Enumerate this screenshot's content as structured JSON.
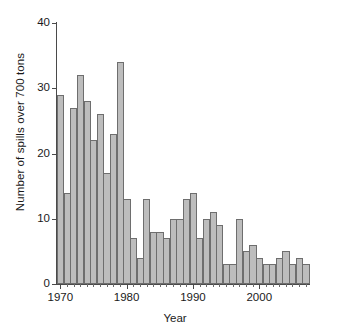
{
  "chart_data": {
    "type": "bar",
    "title": "",
    "subtitle": "",
    "xlabel": "Year",
    "ylabel": "Number of spills over 700 tons",
    "xlim": [
      1969,
      2008
    ],
    "ylim": [
      0,
      40
    ],
    "ytick_labels": [
      "0",
      "10",
      "20",
      "30",
      "40"
    ],
    "ytick_values": [
      0,
      10,
      20,
      30,
      40
    ],
    "xtick_labels": [
      "1970",
      "1980",
      "1990",
      "2000"
    ],
    "xtick_values": [
      1970,
      1980,
      1990,
      2000
    ],
    "grid": false,
    "legend": null,
    "annotations": [],
    "bar_color": "#bdbdbd",
    "bar_edge_color": "#6e6e6e",
    "categories": [
      "1970",
      "1971",
      "1972",
      "1973",
      "1974",
      "1975",
      "1976",
      "1977",
      "1978",
      "1979",
      "1980",
      "1981",
      "1982",
      "1983",
      "1984",
      "1985",
      "1986",
      "1987",
      "1988",
      "1989",
      "1990",
      "1991",
      "1992",
      "1993",
      "1994",
      "1995",
      "1996",
      "1997",
      "1998",
      "1999",
      "2000",
      "2001",
      "2002",
      "2003",
      "2004",
      "2005",
      "2006",
      "2007"
    ],
    "values": [
      29,
      14,
      27,
      32,
      28,
      22,
      26,
      17,
      23,
      34,
      13,
      7,
      4,
      13,
      8,
      8,
      7,
      10,
      10,
      13,
      14,
      7,
      10,
      11,
      9,
      3,
      3,
      10,
      5,
      6,
      4,
      3,
      3,
      4,
      5,
      3,
      4,
      3
    ]
  },
  "axis": {
    "y_title": "Number of spills over 700 tons",
    "x_title": "Year"
  }
}
